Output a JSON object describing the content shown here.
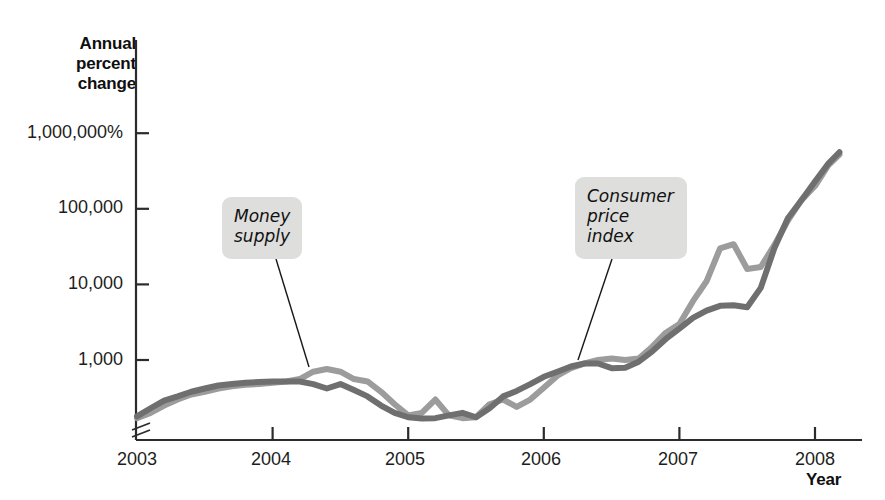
{
  "chart_data": {
    "type": "line",
    "title": "",
    "xlabel": "Year",
    "ylabel": "Annual percent change",
    "ylabel_lines": [
      "Annual",
      "percent",
      "change"
    ],
    "yscale": "log",
    "grid": false,
    "legend": "annotated-callouts",
    "y_ticks": [
      "1,000,000%",
      "100,000",
      "10,000",
      "1,000"
    ],
    "y_tick_values": [
      1000000,
      100000,
      10000,
      1000
    ],
    "x_ticks": [
      "2003",
      "2004",
      "2005",
      "2006",
      "2007",
      "2008"
    ],
    "x_tick_values": [
      2003,
      2004,
      2005,
      2006,
      2007,
      2008
    ],
    "xlim": [
      2002.92,
      2008.25
    ],
    "ylim": [
      110,
      3000000
    ],
    "axis_break": true,
    "series": [
      {
        "name": "Money supply",
        "color": "#9c9c9c",
        "callout": "Money supply",
        "callout_lines": [
          "Money",
          "supply"
        ],
        "x": [
          2003.0,
          2003.1,
          2003.2,
          2003.3,
          2003.4,
          2003.5,
          2003.6,
          2003.7,
          2003.8,
          2003.9,
          2004.0,
          2004.1,
          2004.2,
          2004.3,
          2004.4,
          2004.5,
          2004.6,
          2004.7,
          2004.8,
          2004.9,
          2005.0,
          2005.1,
          2005.2,
          2005.3,
          2005.4,
          2005.5,
          2005.6,
          2005.7,
          2005.8,
          2005.9,
          2006.0,
          2006.1,
          2006.2,
          2006.3,
          2006.4,
          2006.5,
          2006.6,
          2006.7,
          2006.8,
          2006.9,
          2007.0,
          2007.1,
          2007.2,
          2007.3,
          2007.4,
          2007.5,
          2007.6,
          2007.7,
          2007.8,
          2007.9,
          2008.0,
          2008.1,
          2008.18
        ],
        "y": [
          170,
          200,
          250,
          300,
          350,
          380,
          420,
          450,
          470,
          480,
          500,
          520,
          560,
          700,
          760,
          700,
          560,
          520,
          380,
          260,
          185,
          200,
          300,
          185,
          170,
          175,
          260,
          300,
          240,
          300,
          430,
          620,
          780,
          900,
          1000,
          1050,
          1000,
          1050,
          1500,
          2300,
          3000,
          6000,
          11000,
          30000,
          34000,
          16000,
          17000,
          33000,
          70000,
          130000,
          200000,
          380000,
          520000
        ]
      },
      {
        "name": "Consumer price index",
        "color": "#6f6f6f",
        "callout": "Consumer price index",
        "callout_lines": [
          "Consumer",
          "price",
          "index"
        ],
        "x": [
          2003.0,
          2003.1,
          2003.2,
          2003.3,
          2003.4,
          2003.5,
          2003.6,
          2003.7,
          2003.8,
          2003.9,
          2004.0,
          2004.1,
          2004.2,
          2004.3,
          2004.4,
          2004.5,
          2004.6,
          2004.7,
          2004.8,
          2004.9,
          2005.0,
          2005.1,
          2005.2,
          2005.3,
          2005.4,
          2005.5,
          2005.6,
          2005.7,
          2005.8,
          2005.9,
          2006.0,
          2006.1,
          2006.2,
          2006.3,
          2006.4,
          2006.5,
          2006.6,
          2006.7,
          2006.8,
          2006.9,
          2007.0,
          2007.1,
          2007.2,
          2007.3,
          2007.4,
          2007.5,
          2007.6,
          2007.7,
          2007.8,
          2007.9,
          2008.0,
          2008.1,
          2008.18
        ],
        "y": [
          180,
          230,
          290,
          330,
          380,
          420,
          460,
          480,
          500,
          510,
          520,
          520,
          520,
          480,
          420,
          480,
          400,
          330,
          250,
          200,
          175,
          168,
          170,
          185,
          200,
          175,
          230,
          330,
          390,
          480,
          600,
          700,
          820,
          900,
          900,
          780,
          790,
          950,
          1300,
          1900,
          2600,
          3600,
          4500,
          5200,
          5300,
          5000,
          9000,
          30000,
          75000,
          130000,
          230000,
          400000,
          560000
        ]
      }
    ]
  },
  "axes": {
    "y_title_lines": [
      "Annual",
      "percent",
      "change"
    ],
    "x_title": "Year"
  }
}
